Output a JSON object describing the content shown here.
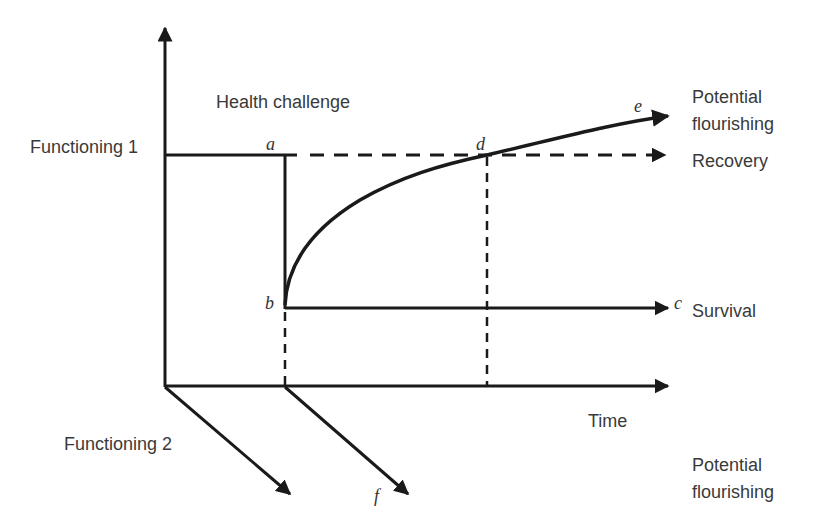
{
  "diagram": {
    "type": "health-trajectory-diagram",
    "axes": {
      "vertical_label": "Functioning 1",
      "horizontal_label": "Time",
      "depth_label": "Functioning 2"
    },
    "event_label": "Health challenge",
    "points": {
      "a": "a",
      "b": "b",
      "c": "c",
      "d": "d",
      "e": "e",
      "f": "f"
    },
    "outcomes": {
      "flourishing_top": [
        "Potential",
        "flourishing"
      ],
      "recovery": "Recovery",
      "survival": "Survival",
      "flourishing_bottom": [
        "Potential",
        "flourishing"
      ]
    },
    "colors": {
      "line": "#1a1a1a",
      "text": "#3a3a3a"
    }
  }
}
